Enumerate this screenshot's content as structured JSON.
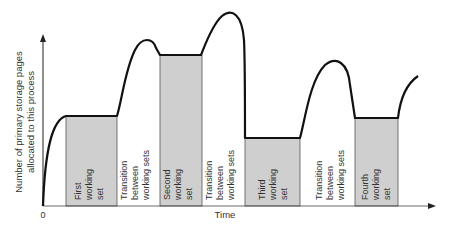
{
  "diagram": {
    "y_axis_label": [
      "Number of primary storage pages",
      "allocated to this process"
    ],
    "x_axis_label": "Time",
    "origin_label": "0",
    "regions": [
      {
        "kind": "working-set",
        "lines": [
          "First",
          "working",
          "set"
        ]
      },
      {
        "kind": "transition",
        "lines": [
          "Transition",
          "between",
          "working sets"
        ]
      },
      {
        "kind": "working-set",
        "lines": [
          "Second",
          "working",
          "set"
        ]
      },
      {
        "kind": "transition",
        "lines": [
          "Transition",
          "between",
          "working sets"
        ]
      },
      {
        "kind": "working-set",
        "lines": [
          "Third",
          "working",
          "set"
        ]
      },
      {
        "kind": "transition",
        "lines": [
          "Transition",
          "between",
          "working sets"
        ]
      },
      {
        "kind": "working-set",
        "lines": [
          "Fourth",
          "working",
          "set"
        ]
      }
    ],
    "colors": {
      "shade": "#cfcfcf",
      "line": "#111111",
      "text": "#333333"
    }
  }
}
